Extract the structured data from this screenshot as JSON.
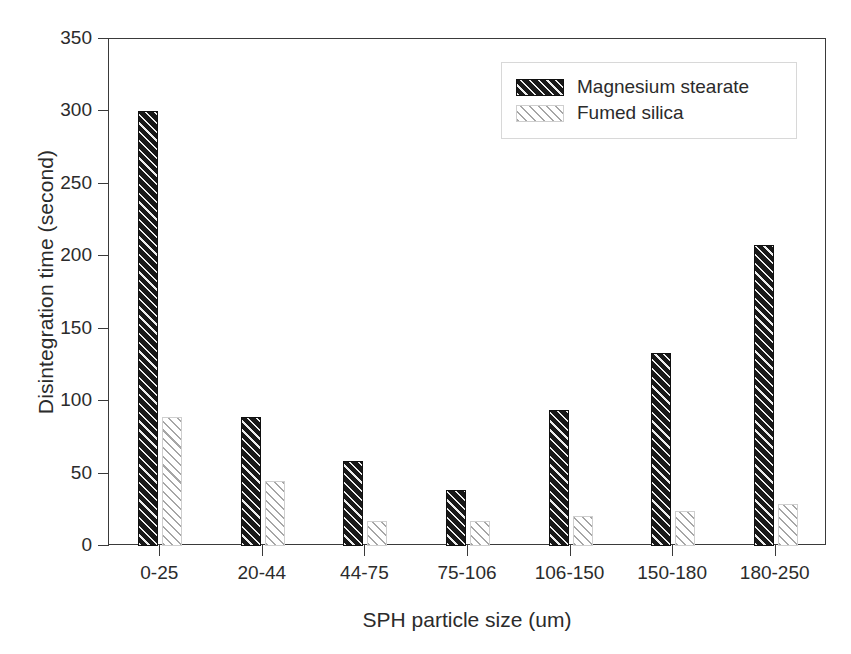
{
  "chart_data": {
    "type": "bar",
    "title": "",
    "xlabel": "SPH particle size (um)",
    "ylabel": "Disintegration time (second)",
    "categories": [
      "0-25",
      "20-44",
      "44-75",
      "75-106",
      "106-150",
      "150-180",
      "180-250"
    ],
    "series": [
      {
        "name": "Magnesium stearate",
        "values": [
          300,
          89,
          59,
          39,
          94,
          133,
          208
        ],
        "color": "#181818",
        "pattern": "dark-hatch"
      },
      {
        "name": "Fumed silica",
        "values": [
          89,
          45,
          17,
          17,
          21,
          24,
          29
        ],
        "color": "#c8c8c8",
        "pattern": "light-hatch"
      }
    ],
    "ylim": [
      0,
      350
    ],
    "yticks": [
      0,
      50,
      100,
      150,
      200,
      250,
      300,
      350
    ],
    "ytick_labels": [
      "0",
      "50",
      "100",
      "150",
      "200",
      "250",
      "300",
      "350"
    ],
    "grid": false,
    "legend_position": "top-right"
  },
  "legend": {
    "entries": [
      {
        "label": "Magnesium stearate"
      },
      {
        "label": "Fumed silica"
      }
    ]
  }
}
